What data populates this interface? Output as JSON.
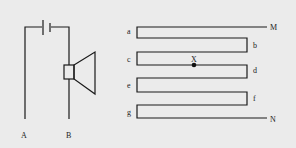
{
  "circuit": {
    "terminals": [
      {
        "id": "A",
        "label": "A"
      },
      {
        "id": "B",
        "label": "B"
      }
    ],
    "components": [
      "battery",
      "speaker"
    ]
  },
  "serpentine": {
    "corner_labels": {
      "a": "a",
      "b": "b",
      "c": "c",
      "d": "d",
      "e": "e",
      "f": "f",
      "g": "g"
    },
    "end_labels": {
      "M": "M",
      "N": "N"
    },
    "point": {
      "label": "X"
    }
  },
  "colors": {
    "line": "#1a1a1a",
    "background": "#ebebeb"
  }
}
